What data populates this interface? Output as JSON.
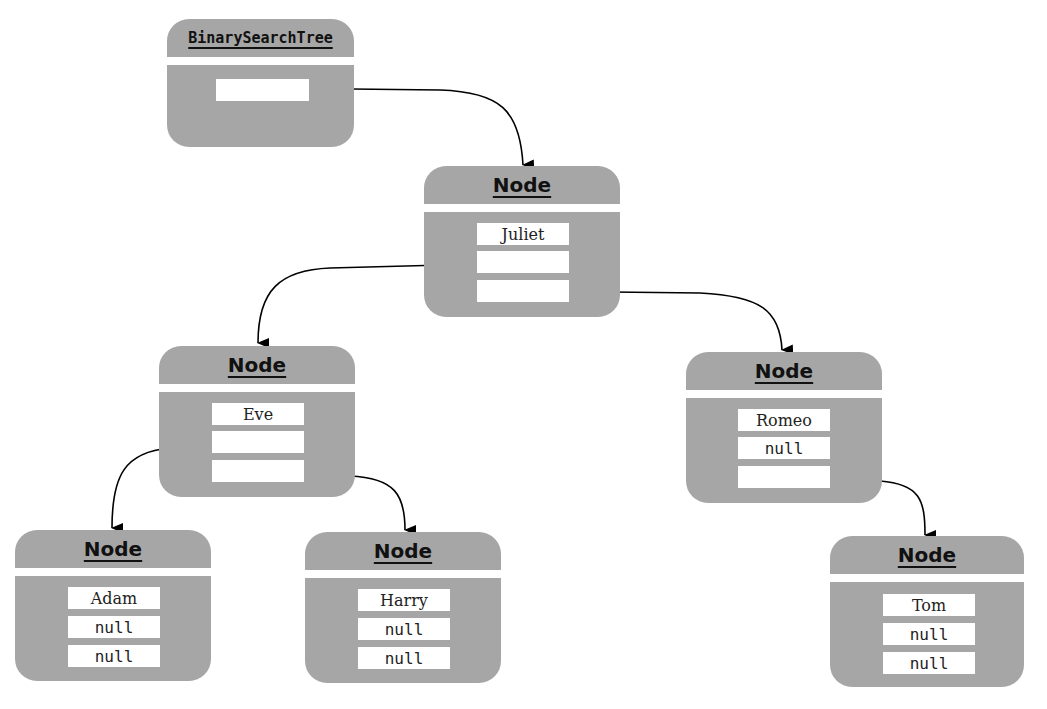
{
  "diagram": {
    "type": "object-diagram",
    "colors": {
      "box_fill": "#a6a6a6",
      "field_fill": "#ffffff",
      "text": "#111111",
      "arrow": "#000000"
    },
    "tree": {
      "title": "BinarySearchTree",
      "root_field": ""
    },
    "nodes": {
      "juliet": {
        "title": "Node",
        "data": "Juliet",
        "left": "",
        "right": ""
      },
      "eve": {
        "title": "Node",
        "data": "Eve",
        "left": "",
        "right": ""
      },
      "romeo": {
        "title": "Node",
        "data": "Romeo",
        "left": "null",
        "right": ""
      },
      "adam": {
        "title": "Node",
        "data": "Adam",
        "left": "null",
        "right": "null"
      },
      "harry": {
        "title": "Node",
        "data": "Harry",
        "left": "null",
        "right": "null"
      },
      "tom": {
        "title": "Node",
        "data": "Tom",
        "left": "null",
        "right": "null"
      }
    },
    "edges": [
      {
        "from": "BinarySearchTree.root",
        "to": "juliet"
      },
      {
        "from": "juliet.left",
        "to": "eve"
      },
      {
        "from": "juliet.right",
        "to": "romeo"
      },
      {
        "from": "eve.left",
        "to": "adam"
      },
      {
        "from": "eve.right",
        "to": "harry"
      },
      {
        "from": "romeo.right",
        "to": "tom"
      }
    ]
  }
}
